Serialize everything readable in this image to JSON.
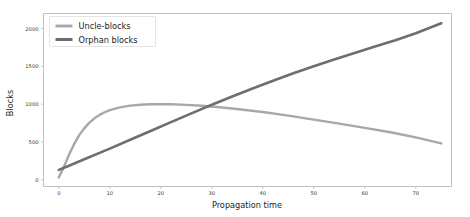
{
  "chart_data": {
    "type": "line",
    "title": "",
    "xlabel": "Propagation time",
    "ylabel": "Blocks",
    "xlim": [
      -3,
      77
    ],
    "ylim": [
      -90,
      2200
    ],
    "xticks": [
      0,
      10,
      20,
      30,
      40,
      50,
      60,
      70
    ],
    "yticks": [
      0,
      500,
      1000,
      1500,
      2000
    ],
    "xtick_labels": [
      "0",
      "10",
      "20",
      "30",
      "40",
      "50",
      "60",
      "70"
    ],
    "ytick_labels": [
      "0",
      "500",
      "1000",
      "1500",
      "2000"
    ],
    "grid": false,
    "legend_position": "upper left",
    "series": [
      {
        "name": "Uncle-blocks",
        "color": "#a8a8a8",
        "linewidth": 2.4,
        "x": [
          0,
          1,
          2,
          3,
          4,
          5,
          6,
          7,
          8,
          9,
          10,
          12,
          14,
          16,
          18,
          20,
          22,
          25,
          28,
          31,
          34,
          37,
          40,
          45,
          50,
          55,
          60,
          65,
          70,
          75
        ],
        "values": [
          30,
          170,
          330,
          470,
          590,
          680,
          755,
          812,
          858,
          893,
          920,
          958,
          980,
          992,
          998,
          1000,
          998,
          990,
          978,
          962,
          942,
          920,
          896,
          848,
          796,
          742,
          686,
          628,
          560,
          480
        ]
      },
      {
        "name": "Orphan blocks",
        "color": "#6e6e6e",
        "linewidth": 2.6,
        "x": [
          0,
          2,
          5,
          8,
          10,
          14,
          18,
          22,
          26,
          30,
          34,
          38,
          42,
          46,
          50,
          54,
          58,
          62,
          66,
          70,
          75
        ],
        "values": [
          130,
          185,
          270,
          355,
          412,
          528,
          645,
          762,
          878,
          992,
          1102,
          1208,
          1310,
          1408,
          1502,
          1592,
          1678,
          1762,
          1845,
          1938,
          2070
        ]
      }
    ]
  },
  "legend": {
    "entries": [
      {
        "label": "Uncle-blocks"
      },
      {
        "label": "Orphan blocks"
      }
    ]
  },
  "axes": {
    "x_title": "Propagation time",
    "y_title": "Blocks"
  }
}
